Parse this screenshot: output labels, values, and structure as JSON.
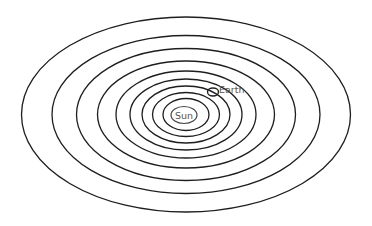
{
  "diagram": {
    "type": "concentric-orbits",
    "center": {
      "x": 186,
      "y": 114.5
    },
    "stroke_color": "#1e1e1e",
    "label_color": "#555555",
    "sun": {
      "label": "Sun",
      "cx": 184,
      "cy": 115,
      "rx": 13,
      "ry": 8.5
    },
    "earth": {
      "label": "Earth",
      "cx": 213,
      "cy": 92,
      "rx": 5.5,
      "ry": 4,
      "orbit_index": 2
    },
    "orbits": [
      {
        "rx": 23,
        "ry": 16
      },
      {
        "rx": 33.5,
        "ry": 22
      },
      {
        "rx": 44,
        "ry": 28.5
      },
      {
        "rx": 56,
        "ry": 35.5
      },
      {
        "rx": 70,
        "ry": 43.5
      },
      {
        "rx": 88.5,
        "ry": 53.5
      },
      {
        "rx": 109.5,
        "ry": 66
      },
      {
        "rx": 134,
        "ry": 79
      },
      {
        "rx": 164.5,
        "ry": 97.5
      }
    ]
  }
}
